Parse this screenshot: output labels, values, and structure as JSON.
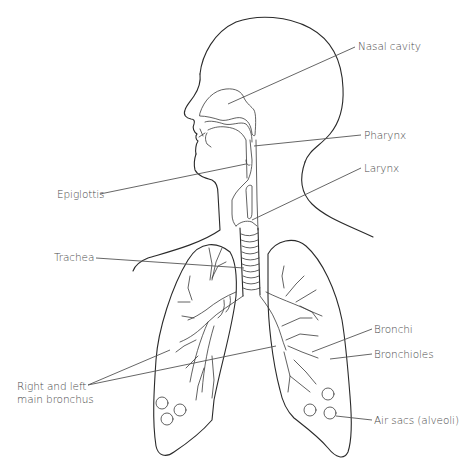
{
  "diagram": {
    "type": "anatomical-line-drawing",
    "colors": {
      "background": "#ffffff",
      "line": "#2a2a2a",
      "leader": "#555555",
      "label_text": "#4a4a4a"
    },
    "labels": [
      {
        "id": "nasal-cavity",
        "text": "Nasal cavity",
        "side": "right",
        "x": 358,
        "y": 40
      },
      {
        "id": "pharynx",
        "text": "Pharynx",
        "side": "right",
        "x": 364,
        "y": 129
      },
      {
        "id": "epiglottis",
        "text": "Epiglottis",
        "side": "left",
        "x": 57,
        "y": 188
      },
      {
        "id": "larynx",
        "text": "Larynx",
        "side": "right",
        "x": 364,
        "y": 162
      },
      {
        "id": "trachea",
        "text": "Trachea",
        "side": "left",
        "x": 54,
        "y": 251
      },
      {
        "id": "bronchi",
        "text": "Bronchi",
        "side": "right",
        "x": 374,
        "y": 323
      },
      {
        "id": "bronchioles",
        "text": "Bronchioles",
        "side": "right",
        "x": 374,
        "y": 348
      },
      {
        "id": "main-bronchus",
        "text": "Right and left\nmain bronchus",
        "side": "left",
        "x": 17,
        "y": 382
      },
      {
        "id": "air-sacs",
        "text": "Air sacs (alveoli)",
        "side": "right",
        "x": 374,
        "y": 414
      }
    ]
  }
}
